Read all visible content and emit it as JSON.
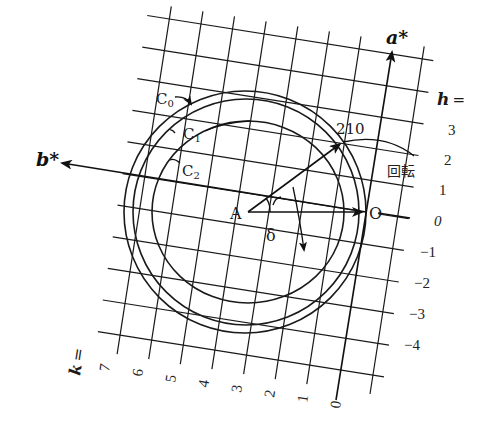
{
  "figure": {
    "type": "Ewald-sphere rotation diagram (reciprocal lattice)",
    "axes": {
      "a_star": "a*",
      "b_star": "b*"
    },
    "points": {
      "A": "A",
      "O": "O",
      "reflection": "210"
    },
    "angle_label": "δ",
    "rotation_label": "回転",
    "circles": [
      {
        "id": "C0",
        "label": "C₀",
        "sub": "0"
      },
      {
        "id": "C1",
        "label": "C₁",
        "sub": "1"
      },
      {
        "id": "C2",
        "label": "C₂",
        "sub": "2"
      }
    ],
    "h_axis": {
      "title": "h =",
      "values": [
        "3",
        "2",
        "1",
        "0",
        "−1",
        "−2",
        "−3",
        "−4"
      ]
    },
    "k_axis": {
      "title": "k =",
      "values": [
        "7",
        "6",
        "5",
        "4",
        "3",
        "2",
        "1",
        "0"
      ]
    },
    "colors": {
      "ink": "#1a1a1a",
      "background": "#ffffff"
    }
  }
}
